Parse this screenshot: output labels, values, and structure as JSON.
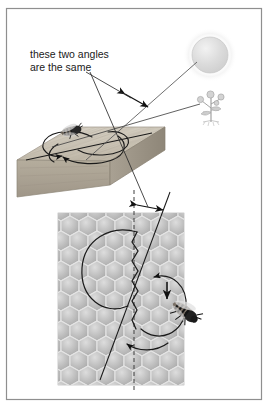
{
  "figure": {
    "annotation": {
      "line1": "these two angles",
      "line2": "are the same"
    },
    "frame": {
      "border_color": "#8a8a8a",
      "background": "#ffffff",
      "x": 6,
      "y": 8,
      "width": 256,
      "height": 392
    },
    "scenes": [
      {
        "name": "outdoor-horizontal-scene",
        "description": "Bee dancing on a horizontal wooden board in the open, with the sun and a flower",
        "elements": [
          {
            "name": "sun",
            "label": "sun",
            "color": "#d8d8d8",
            "cx": 210,
            "cy": 55,
            "r": 18
          },
          {
            "name": "flower",
            "label": "flower",
            "color": "#b8b8b8",
            "cx": 211,
            "cy": 106
          },
          {
            "name": "wooden-board",
            "label": "wooden board",
            "color": "#c9c3b6"
          },
          {
            "name": "bee-outdoor",
            "label": "bee",
            "color": "#2b2b2b"
          },
          {
            "name": "dance-path-outdoor",
            "label": "figure-eight dance path",
            "color": "#1a1a1a"
          },
          {
            "name": "sun-direction-line",
            "label": "line to sun",
            "color": "#4a4a4a"
          },
          {
            "name": "flower-direction-line",
            "label": "line to flower",
            "color": "#4a4a4a"
          },
          {
            "name": "angle-marker-outdoor",
            "label": "angle between sun direction and waggle run",
            "color": "#111111"
          }
        ]
      },
      {
        "name": "honeycomb-vertical-scene",
        "description": "Bee dancing on a vertical honeycomb, waggle run angled from vertical",
        "elements": [
          {
            "name": "honeycomb",
            "label": "honeycomb",
            "color": "#c4c4c4"
          },
          {
            "name": "bee-honeycomb",
            "label": "bee",
            "color": "#2b2b2b"
          },
          {
            "name": "dance-path-honeycomb",
            "label": "figure-eight dance path",
            "color": "#1a1a1a"
          },
          {
            "name": "vertical-reference-line",
            "label": "vertical reference (gravity) line",
            "color": "#3a3a3a",
            "style": "dashed"
          },
          {
            "name": "waggle-run-line",
            "label": "waggle run direction line",
            "color": "#1a1a1a"
          },
          {
            "name": "angle-marker-honeycomb",
            "label": "angle between vertical and waggle run",
            "color": "#111111"
          }
        ]
      }
    ],
    "leaders": [
      {
        "name": "leader-to-outdoor-angle",
        "from": "annotation",
        "to": "angle-marker-outdoor"
      },
      {
        "name": "leader-to-honeycomb-angle",
        "from": "annotation",
        "to": "angle-marker-honeycomb"
      }
    ]
  }
}
